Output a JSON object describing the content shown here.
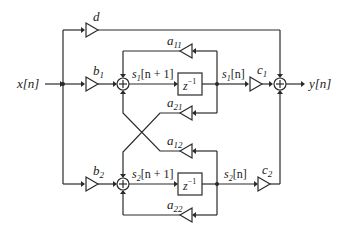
{
  "diagram": {
    "type": "signal-flow block diagram (2nd-order state-space filter)",
    "input": {
      "label": "x[n]"
    },
    "output": {
      "label": "y[n]"
    },
    "gains": {
      "d": "d",
      "b1": {
        "sym": "b",
        "sub": "1"
      },
      "b2": {
        "sym": "b",
        "sub": "2"
      },
      "c1": {
        "sym": "c",
        "sub": "1"
      },
      "c2": {
        "sym": "c",
        "sub": "2"
      },
      "a11": {
        "sym": "a",
        "sub": "11"
      },
      "a21": {
        "sym": "a",
        "sub": "21"
      },
      "a12": {
        "sym": "a",
        "sub": "12"
      },
      "a22": {
        "sym": "a",
        "sub": "22"
      }
    },
    "delays": {
      "delay1": {
        "base": "z",
        "exp": "−1"
      },
      "delay2": {
        "base": "z",
        "exp": "−1"
      }
    },
    "signals": {
      "s1_next": {
        "sym": "s",
        "sub": "1",
        "arg": "[n + 1]"
      },
      "s1": {
        "sym": "s",
        "sub": "1",
        "arg": "[n]"
      },
      "s2_next": {
        "sym": "s",
        "sub": "2",
        "arg": "[n + 1]"
      },
      "s2": {
        "sym": "s",
        "sub": "2",
        "arg": "[n]"
      }
    },
    "adders": {
      "symbol": "+"
    }
  }
}
